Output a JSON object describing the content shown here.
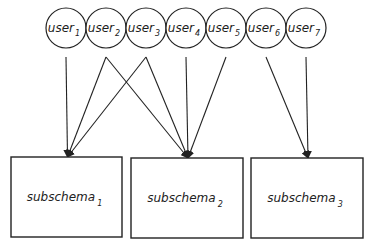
{
  "diagram": {
    "users": [
      {
        "name": "user",
        "sub": "1",
        "cx": 66
      },
      {
        "name": "user",
        "sub": "2",
        "cx": 106
      },
      {
        "name": "user",
        "sub": "3",
        "cx": 146
      },
      {
        "name": "user",
        "sub": "4",
        "cx": 186
      },
      {
        "name": "user",
        "sub": "5",
        "cx": 226
      },
      {
        "name": "user",
        "sub": "6",
        "cx": 266
      },
      {
        "name": "user",
        "sub": "7",
        "cx": 306
      }
    ],
    "subschemas": [
      {
        "name": "subschema",
        "sub": "1",
        "x": 11,
        "y": 157,
        "w": 111,
        "h": 80
      },
      {
        "name": "subschema",
        "sub": "2",
        "x": 131,
        "y": 158,
        "w": 112,
        "h": 80
      },
      {
        "name": "subschema",
        "sub": "3",
        "x": 251,
        "y": 158,
        "w": 112,
        "h": 80
      }
    ],
    "edges": [
      {
        "from": 0,
        "to": 0
      },
      {
        "from": 1,
        "to": 0
      },
      {
        "from": 1,
        "to": 1
      },
      {
        "from": 2,
        "to": 0
      },
      {
        "from": 2,
        "to": 1
      },
      {
        "from": 3,
        "to": 1
      },
      {
        "from": 4,
        "to": 1
      },
      {
        "from": 5,
        "to": 2
      },
      {
        "from": 6,
        "to": 2
      }
    ],
    "colors": {
      "stroke": "#222222",
      "background": "#ffffff"
    }
  }
}
